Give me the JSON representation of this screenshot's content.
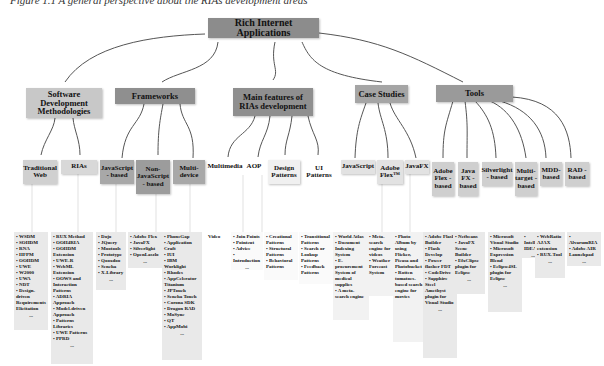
{
  "caption": "Figure 1.1 A general perspective about the RIAs development areas",
  "root": {
    "label": "Rich Internet Applications",
    "color": "#8c8c8c"
  },
  "categories": [
    {
      "label": "Software Development Methodologies",
      "color": "#c8c8c8",
      "children": [
        {
          "label": "Traditional Web",
          "items": [
            "WSDM",
            "SOHDM",
            "RNA",
            "HFPM",
            "OOHDM",
            "UWE",
            "W2000",
            "UWA",
            "NDT",
            "Design-driven Requirements Elicitation"
          ],
          "more": "..."
        },
        {
          "label": "RIAs",
          "items": [
            "RUX Method",
            "OOH4RIA",
            "OOHDM Extension",
            "UWE-R",
            "WebML Extension",
            "OOWS and Interaction Patterns",
            "ADRIA Approach",
            "Model-driven Approach",
            "Patterns Libraries",
            "UWE Patterns",
            "PPRD"
          ],
          "more": "..."
        }
      ]
    },
    {
      "label": "Frameworks",
      "color": "#8f8f8f",
      "children": [
        {
          "label": "JavaScript - based",
          "items": [
            "Dojo",
            "JQuery",
            "Mootools",
            "Prototype",
            "Qooxdoo",
            "Sencha",
            "X-Library"
          ],
          "more": "..."
        },
        {
          "label": "Non-JavaScript - based",
          "items": [
            "Adobe Flex",
            "JavaFX",
            "Silverlight",
            "OpenLaszlo"
          ],
          "more": "..."
        },
        {
          "label": "Multi-device",
          "items": [
            "PhoneGap",
            "Application Craft",
            "IUI",
            "IBM Worklight",
            "Rhodes",
            "AppCelerator Titanium",
            "JPTouch",
            "Sencha Touch",
            "Corona SDK",
            "Dragon RAD",
            "MoSync",
            "QT",
            "AppMobi"
          ],
          "more": "..."
        }
      ]
    },
    {
      "label": "Main features of RIAs development",
      "color": "#8f8f8f",
      "children": [
        {
          "label": "Multimedia",
          "items": [
            "Video"
          ],
          "more": ""
        },
        {
          "label": "AOP",
          "items": [
            "Join Points",
            "Pointcut",
            "Advice",
            "Introduction"
          ],
          "more": "..."
        },
        {
          "label": "Design Patterns",
          "items": [
            "Creational Patterns",
            "Structural Patterns",
            "Behavioral Patterns"
          ],
          "more": ""
        },
        {
          "label": "UI Patterns",
          "items": [
            "Transitional Patterns",
            "Search or Lookup Patterns",
            "Feedback Patterns"
          ],
          "more": ""
        }
      ]
    },
    {
      "label": "Case Studies",
      "color": "#a5a5a5",
      "children": [
        {
          "label": "JavaScript",
          "items": [
            "World Atlas",
            "Document Indexing System",
            "E-procurement System of medical supplies",
            "A meta-search engine"
          ],
          "more": ""
        },
        {
          "label": "Adobe Flex™",
          "items": [
            "Meta-search engine for videos",
            "Weather Forecast System"
          ],
          "more": ""
        },
        {
          "label": "JavaFX",
          "items": [
            "Photo Album by using Flicker, Picasa and Photobucket",
            "Rotten tomatoes-based search engine for movies"
          ],
          "more": ""
        }
      ]
    },
    {
      "label": "Tools",
      "color": "#9a9a9a",
      "children": [
        {
          "label": "Adobe Flex - based",
          "items": [
            "Adobe Flash Builder",
            "Flash Develop",
            "Power flasher FDT",
            "CodeDrive",
            "Sapphire Steel Amethyst plugin for Visual Studio"
          ],
          "more": "..."
        },
        {
          "label": "Java FX - based",
          "items": [
            "Netbeans",
            "JavaFX Scene Builder",
            "EfxClipse plugin for Eclipse"
          ],
          "more": "..."
        },
        {
          "label": "Silverlight - based",
          "items": [
            "Microsoft Visual Studio",
            "Microsoft Expression Blend",
            "Eclipse4SL plugin for Eclipse"
          ],
          "more": "..."
        },
        {
          "label": "Multi-target - based",
          "items": [
            "IntelliJ IDEA"
          ],
          "more": "..."
        },
        {
          "label": "MDD-based",
          "items": [
            "WebRatio AJAX extension",
            "RUX-Tool"
          ],
          "more": "..."
        },
        {
          "label": "RAD - based",
          "items": [
            "AlvarumRIA",
            "Adobe AIR Launchpad"
          ],
          "more": "..."
        }
      ]
    }
  ]
}
